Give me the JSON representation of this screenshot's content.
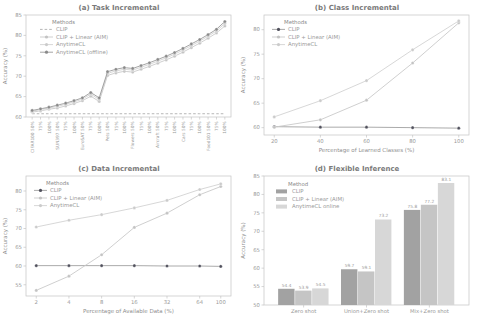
{
  "figure": {
    "text_color": "#8f8f8f",
    "spine_color": "#c4c4c4"
  },
  "chart_data": [
    {
      "id": "a",
      "type": "line",
      "title": "(a) Task Incremental",
      "xlabel": "",
      "ylabel": "Accuracy (%)",
      "ylim": [
        60,
        85
      ],
      "yticks": [
        60,
        65,
        70,
        75,
        80,
        85
      ],
      "xtick_rotation": -90,
      "categories": [
        "CIFAR100 50%",
        "75%",
        "100%",
        "SUN397 50%",
        "75%",
        "100%",
        "EuroSAT 50%",
        "75%",
        "100%",
        "Pets 50%",
        "75%",
        "100%",
        "Flowers 50%",
        "75%",
        "100%",
        "Aircraft 50%",
        "75%",
        "100%",
        "Cars 50%",
        "75%",
        "100%",
        "Food101 50%",
        "75%",
        "100%"
      ],
      "legend": {
        "title": "Methods",
        "position": "upper-left",
        "dx": 14,
        "dy": 3
      },
      "series": [
        {
          "name": "CLIP",
          "color": "#aeaeae",
          "dash": true,
          "marker": false,
          "values": [
            60.8,
            60.8,
            60.8,
            60.8,
            60.8,
            60.8,
            60.8,
            60.8,
            60.8,
            60.8,
            60.8,
            60.8,
            60.8,
            60.8,
            60.8,
            60.8,
            60.8,
            60.8,
            60.8,
            60.8,
            60.8,
            60.8,
            60.8,
            60.8
          ]
        },
        {
          "name": "CLIP + Linear (AIM)",
          "color": "#c9c9c9",
          "marker_color": "#c3c3c3",
          "values": [
            61.2,
            61.5,
            61.9,
            62.2,
            62.7,
            63.3,
            64.0,
            65.1,
            63.8,
            70.2,
            70.8,
            71.2,
            71.0,
            71.7,
            72.4,
            73.2,
            74.0,
            74.9,
            75.9,
            77.0,
            78.1,
            79.3,
            80.6,
            82.3
          ]
        },
        {
          "name": "AnytimeCL",
          "color": "#d2d2d2",
          "marker_color": "#cbcbcb",
          "values": [
            61.4,
            61.8,
            62.2,
            62.6,
            63.1,
            63.7,
            64.4,
            65.6,
            64.3,
            70.7,
            71.3,
            71.7,
            71.5,
            72.2,
            72.9,
            73.7,
            74.5,
            75.4,
            76.4,
            77.5,
            78.6,
            79.8,
            81.1,
            82.9
          ]
        },
        {
          "name": "AnytimeCL (offline)",
          "color": "#9a9a9a",
          "marker_color": "#8a8a8a",
          "values": [
            61.6,
            62.0,
            62.4,
            62.9,
            63.4,
            64.0,
            64.7,
            66.0,
            64.7,
            71.1,
            71.7,
            72.1,
            71.9,
            72.6,
            73.3,
            74.1,
            74.9,
            75.8,
            76.8,
            77.9,
            79.0,
            80.2,
            81.5,
            83.4
          ]
        }
      ]
    },
    {
      "id": "b",
      "type": "line",
      "title": "(b) Class Incremental",
      "xlabel": "Percentage of Learned Classes (%)",
      "ylabel": "Accuracy (%)",
      "ylim": [
        58.5,
        83
      ],
      "yticks": [
        60,
        65,
        70,
        75,
        80
      ],
      "x": [
        20,
        40,
        60,
        80,
        100
      ],
      "legend": {
        "title": "Methods",
        "position": "upper-left",
        "dx": 8,
        "dy": 3
      },
      "series": [
        {
          "name": "CLIP",
          "color": "#a0a0a0",
          "marker_color": "#50505c",
          "values": [
            60.2,
            60.1,
            60.1,
            60.0,
            59.9
          ]
        },
        {
          "name": "CLIP + Linear (AIM)",
          "color": "#c9c9c9",
          "marker_color": "#c3c3c3",
          "values": [
            60.1,
            61.6,
            65.6,
            73.2,
            81.4
          ]
        },
        {
          "name": "AnytimeCL",
          "color": "#d2d2d2",
          "marker_color": "#cbcbcb",
          "values": [
            62.2,
            65.5,
            69.6,
            75.9,
            81.8
          ]
        }
      ]
    },
    {
      "id": "c",
      "type": "line",
      "title": "(c) Data Incremental",
      "xlabel": "Percentage of Available Data (%)",
      "ylabel": "Accuracy (%)",
      "ylim": [
        52,
        84
      ],
      "yticks": [
        55,
        60,
        65,
        70,
        75,
        80
      ],
      "x": [
        2,
        4,
        8,
        16,
        32,
        64,
        100
      ],
      "xscale": "log2",
      "legend": {
        "title": "Methods",
        "position": "upper-left",
        "dx": 8,
        "dy": 3
      },
      "series": [
        {
          "name": "CLIP",
          "color": "#a0a0a0",
          "marker_color": "#50505c",
          "values": [
            60.1,
            60.1,
            60.1,
            60.1,
            60.0,
            60.0,
            59.9
          ]
        },
        {
          "name": "CLIP + Linear (AIM)",
          "color": "#c9c9c9",
          "marker_color": "#c3c3c3",
          "values": [
            53.5,
            57.3,
            63.0,
            70.3,
            74.1,
            79.0,
            81.2
          ]
        },
        {
          "name": "AnytimeCL",
          "color": "#d2d2d2",
          "marker_color": "#cbcbcb",
          "values": [
            70.4,
            72.2,
            73.7,
            75.5,
            77.5,
            80.4,
            81.9
          ]
        }
      ]
    },
    {
      "id": "d",
      "type": "bar",
      "title": "(d) Flexible Inference",
      "xlabel": "",
      "ylabel": "Accuracy (%)",
      "ylim": [
        50,
        85
      ],
      "yticks": [
        50,
        55,
        60,
        65,
        70,
        75,
        80,
        85
      ],
      "categories": [
        "Zero shot",
        "Union+Zero shot",
        "Mix+Zero shot"
      ],
      "show_values": true,
      "legend": {
        "title": "Method",
        "position": "upper-left",
        "dx": 12,
        "dy": 4
      },
      "series": [
        {
          "name": "CLIP",
          "color": "#a2a2a2",
          "values": [
            54.4,
            59.7,
            75.8
          ]
        },
        {
          "name": "CLIP + Linear (AIM)",
          "color": "#c5c5c5",
          "values": [
            53.9,
            59.1,
            77.2
          ]
        },
        {
          "name": "AnytimeCL online",
          "color": "#d7d7d7",
          "values": [
            54.5,
            73.2,
            83.1
          ]
        }
      ]
    }
  ]
}
